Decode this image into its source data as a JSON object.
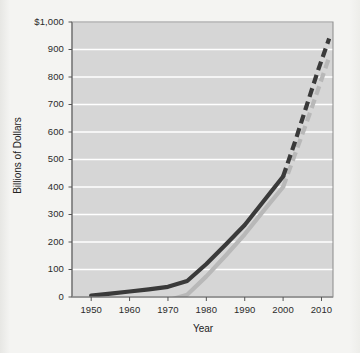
{
  "chart_data": {
    "type": "line",
    "title": "",
    "xlabel": "Year",
    "ylabel": "Billions of Dollars",
    "xlim": [
      1945,
      2013
    ],
    "ylim": [
      0,
      1000
    ],
    "xticks": [
      1950,
      1960,
      1970,
      1980,
      1990,
      2000,
      2010
    ],
    "xtick_labels": [
      "1950",
      "1960",
      "1970",
      "1980",
      "1990",
      "2000",
      "2010"
    ],
    "yticks": [
      0,
      100,
      200,
      300,
      400,
      500,
      600,
      700,
      800,
      900,
      1000
    ],
    "ytick_labels": [
      "0",
      "100",
      "200",
      "300",
      "400",
      "500",
      "600",
      "700",
      "800",
      "900",
      "$1,000"
    ],
    "grid": "horizontal",
    "legend": "none",
    "plot_background": "#d6d6d6",
    "gridline_color": "#ffffff",
    "series": [
      {
        "name": "upper-series",
        "color": "#3a3a3a",
        "solid_segment": {
          "x": [
            1950,
            1955,
            1960,
            1965,
            1970,
            1975,
            1980,
            1985,
            1990,
            1995,
            2000
          ],
          "y": [
            5,
            12,
            20,
            28,
            37,
            58,
            120,
            190,
            262,
            350,
            438
          ]
        },
        "dashed_segment": {
          "x": [
            2000,
            2003,
            2006,
            2009,
            2012
          ],
          "y": [
            438,
            560,
            690,
            820,
            940
          ]
        }
      },
      {
        "name": "lower-series",
        "color": "#b8b8b8",
        "solid_segment": {
          "x": [
            1950,
            1955,
            1960,
            1965,
            1970,
            1975,
            1980,
            1985,
            1990,
            1995,
            2000
          ],
          "y": [
            -30,
            -26,
            -22,
            -18,
            -12,
            8,
            75,
            150,
            228,
            315,
            400
          ]
        },
        "dashed_segment": {
          "x": [
            2000,
            2003,
            2006,
            2009,
            2012
          ],
          "y": [
            400,
            515,
            630,
            750,
            872
          ]
        }
      }
    ]
  }
}
